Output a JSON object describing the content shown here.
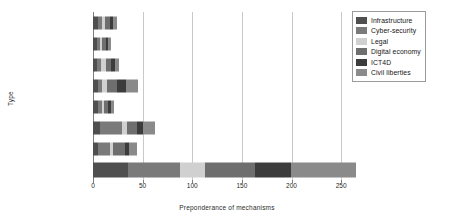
{
  "chart_data": {
    "type": "bar",
    "orientation": "horizontal",
    "stacked": true,
    "title": "",
    "xlabel": "Preponderance of mechanisms",
    "ylabel": "Type",
    "xlim": [
      0,
      270
    ],
    "xticks": [
      0,
      50,
      100,
      150,
      200,
      250
    ],
    "grid": "vertical",
    "legend_position": "top-right",
    "categories": [
      "Treaties, conventions",
      "Judgements, directives",
      "Specialised bodies",
      "Global agendas",
      "Monitoring/benchmarking",
      "Guiding principles",
      "Toolkits/model laws",
      "TOTAL"
    ],
    "series": [
      {
        "name": "Infrastructure",
        "color": "#4f4f4f",
        "values": [
          5,
          4,
          4,
          5,
          5,
          7,
          5,
          35
        ]
      },
      {
        "name": "Cyber-security",
        "color": "#7a7a7a",
        "values": [
          4,
          3,
          4,
          4,
          4,
          22,
          12,
          53
        ]
      },
      {
        "name": "Legal",
        "color": "#d0d0d0",
        "values": [
          3,
          2,
          5,
          5,
          2,
          5,
          3,
          25
        ]
      },
      {
        "name": "Digital economy",
        "color": "#6e6e6e",
        "values": [
          5,
          4,
          5,
          10,
          4,
          10,
          12,
          50
        ]
      },
      {
        "name": "ICT4D",
        "color": "#3c3c3c",
        "values": [
          3,
          2,
          4,
          9,
          3,
          6,
          4,
          37
        ]
      },
      {
        "name": "Civil liberties",
        "color": "#8a8a8a",
        "values": [
          4,
          3,
          4,
          12,
          3,
          12,
          8,
          65
        ]
      }
    ],
    "totals": [
      24,
      18,
      26,
      45,
      21,
      62,
      44,
      265
    ]
  }
}
